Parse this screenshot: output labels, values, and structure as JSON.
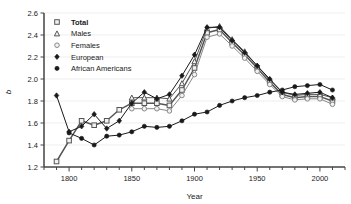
{
  "chart_data": {
    "type": "line",
    "title": "",
    "xlabel": "Year",
    "ylabel": "b",
    "xlim": [
      1780,
      2020
    ],
    "ylim": [
      1.2,
      2.6
    ],
    "grid": true,
    "legend_position": "top-left",
    "xticks_major": [
      1800,
      1850,
      1900,
      1950,
      2000
    ],
    "xtick_minor_step": 10,
    "yticks": [
      1.2,
      1.4,
      1.6,
      1.8,
      2.0,
      2.2,
      2.4,
      2.6
    ],
    "series": [
      {
        "name": "Total",
        "marker": "open-square",
        "color": "#555555",
        "x": [
          1790,
          1800,
          1810,
          1820,
          1830,
          1840,
          1850,
          1860,
          1870,
          1880,
          1890,
          1900,
          1910,
          1920,
          1930,
          1940,
          1950,
          1960,
          1970,
          1980,
          1990,
          2000,
          2010
        ],
        "values": [
          1.25,
          1.44,
          1.62,
          1.58,
          1.62,
          1.72,
          1.78,
          1.78,
          1.78,
          1.76,
          1.9,
          2.1,
          2.42,
          2.45,
          2.33,
          2.22,
          2.1,
          1.97,
          1.86,
          1.83,
          1.84,
          1.84,
          1.8
        ]
      },
      {
        "name": "Males",
        "marker": "open-triangle",
        "color": "#555555",
        "x": [
          1850,
          1860,
          1870,
          1880,
          1890,
          1900,
          1910,
          1920,
          1930,
          1940,
          1950,
          1960,
          1970,
          1980,
          1990,
          2000,
          2010
        ],
        "values": [
          1.83,
          1.83,
          1.83,
          1.82,
          1.96,
          2.16,
          2.46,
          2.48,
          2.36,
          2.25,
          2.12,
          1.99,
          1.88,
          1.85,
          1.86,
          1.86,
          1.83
        ]
      },
      {
        "name": "Females",
        "marker": "open-circle",
        "color": "#888888",
        "x": [
          1850,
          1860,
          1870,
          1880,
          1890,
          1900,
          1910,
          1920,
          1930,
          1940,
          1950,
          1960,
          1970,
          1980,
          1990,
          2000,
          2010
        ],
        "values": [
          1.73,
          1.73,
          1.73,
          1.71,
          1.85,
          2.04,
          2.38,
          2.41,
          2.3,
          2.19,
          2.07,
          1.95,
          1.84,
          1.81,
          1.82,
          1.82,
          1.77
        ]
      },
      {
        "name": "European",
        "marker": "filled-diamond",
        "color": "#1a1a1a",
        "x": [
          1790,
          1800,
          1810,
          1820,
          1830,
          1840,
          1850,
          1860,
          1870,
          1880,
          1890,
          1900,
          1910,
          1920,
          1930,
          1940,
          1950,
          1960,
          1970,
          1980,
          1990,
          2000,
          2010
        ],
        "values": [
          1.85,
          1.52,
          1.57,
          1.68,
          1.55,
          1.62,
          1.78,
          1.88,
          1.82,
          1.86,
          2.03,
          2.22,
          2.47,
          2.47,
          2.35,
          2.24,
          2.12,
          2.0,
          1.88,
          1.86,
          1.87,
          1.88,
          1.83
        ]
      },
      {
        "name": "African Americans",
        "marker": "filled-circle",
        "color": "#1a1a1a",
        "x": [
          1800,
          1810,
          1820,
          1830,
          1840,
          1850,
          1860,
          1870,
          1880,
          1890,
          1900,
          1910,
          1920,
          1930,
          1940,
          1950,
          1960,
          1970,
          1980,
          1990,
          2000,
          2010
        ],
        "values": [
          1.51,
          1.46,
          1.4,
          1.48,
          1.49,
          1.52,
          1.57,
          1.56,
          1.57,
          1.62,
          1.68,
          1.7,
          1.76,
          1.8,
          1.83,
          1.85,
          1.88,
          1.9,
          1.93,
          1.94,
          1.95,
          1.9
        ]
      }
    ]
  },
  "legend": {
    "items": [
      {
        "label": "Total",
        "marker": "open-square",
        "bold": true
      },
      {
        "label": "Males",
        "marker": "open-triangle",
        "bold": false
      },
      {
        "label": "Females",
        "marker": "open-circle",
        "bold": false
      },
      {
        "label": "European",
        "marker": "filled-diamond",
        "bold": false
      },
      {
        "label": "African Americans",
        "marker": "filled-circle",
        "bold": false
      }
    ]
  }
}
